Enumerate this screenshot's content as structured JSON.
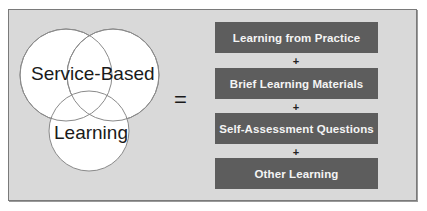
{
  "venn": {
    "label_top": "Service-Based",
    "label_bottom": "Learning"
  },
  "equals_sign": "=",
  "components": [
    {
      "label": "Learning from Practice"
    },
    {
      "label": "Brief Learning Materials"
    },
    {
      "label": "Self-Assessment Questions"
    },
    {
      "label": "Other Learning"
    }
  ],
  "plus_sign": "+",
  "colors": {
    "panel_bg": "#d9d9d9",
    "box_bg": "#5d5d5d",
    "box_text": "#f4f4f4",
    "circle_fill": "#ffffff",
    "circle_stroke": "#8a8a8a"
  }
}
